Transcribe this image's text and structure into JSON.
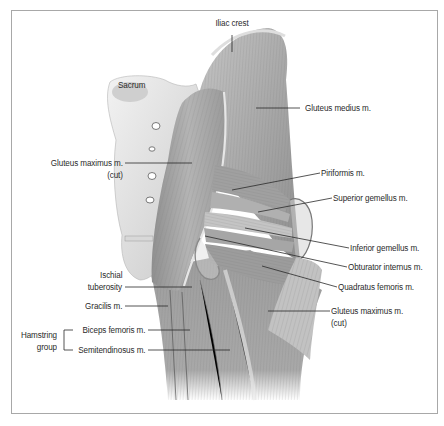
{
  "figure": {
    "frame_color": "#a8a8a8",
    "label_color": "#2a2a2a"
  },
  "labels": [
    {
      "id": "iliac-crest",
      "text": "Iliac crest",
      "x": 232,
      "y": 24,
      "align": "c"
    },
    {
      "id": "sacrum",
      "text": "Sacrum",
      "x": 118,
      "y": 86,
      "align": "l"
    },
    {
      "id": "gluteus-medius",
      "text": "Gluteus medius m.",
      "x": 305,
      "y": 103,
      "align": "l"
    },
    {
      "id": "gluteus-maximus-cut-left-line1",
      "text": "Gluteus maximus m.",
      "x": 123,
      "y": 158,
      "align": "r"
    },
    {
      "id": "gluteus-maximus-cut-left-line2",
      "text": "(cut)",
      "x": 123,
      "y": 170,
      "align": "r"
    },
    {
      "id": "piriformis",
      "text": "Piriformis m.",
      "x": 321,
      "y": 168,
      "align": "l"
    },
    {
      "id": "superior-gemellus",
      "text": "Superior gemellus m.",
      "x": 333,
      "y": 193,
      "align": "l"
    },
    {
      "id": "inferior-gemellus",
      "text": "Inferior gemellus m.",
      "x": 350,
      "y": 243,
      "align": "l"
    },
    {
      "id": "obturator-internus",
      "text": "Obturator internus m.",
      "x": 348,
      "y": 262,
      "align": "l"
    },
    {
      "id": "quadratus-femoris",
      "text": "Quadratus femoris m.",
      "x": 338,
      "y": 282,
      "align": "l"
    },
    {
      "id": "ischial-tuberosity-line1",
      "text": "Ischial",
      "x": 122,
      "y": 270,
      "align": "r"
    },
    {
      "id": "ischial-tuberosity-line2",
      "text": "tuberosity",
      "x": 122,
      "y": 282,
      "align": "r"
    },
    {
      "id": "gluteus-maximus-cut-right-line1",
      "text": "Gluteus maximus m.",
      "x": 331,
      "y": 306,
      "align": "l"
    },
    {
      "id": "gluteus-maximus-cut-right-line2",
      "text": "(cut)",
      "x": 331,
      "y": 318,
      "align": "l"
    },
    {
      "id": "gracilis",
      "text": "Gracilis m.",
      "x": 122,
      "y": 301,
      "align": "r"
    },
    {
      "id": "biceps-femoris",
      "text": "Biceps femoris m.",
      "x": 145,
      "y": 326,
      "align": "r"
    },
    {
      "id": "semitendinosus",
      "text": "Semitendinosus m.",
      "x": 145,
      "y": 346,
      "align": "r"
    },
    {
      "id": "hamstring-group-line1",
      "text": "Hamstring",
      "x": 57,
      "y": 330,
      "align": "r"
    },
    {
      "id": "hamstring-group-line2",
      "text": "group",
      "x": 57,
      "y": 342,
      "align": "r"
    }
  ]
}
